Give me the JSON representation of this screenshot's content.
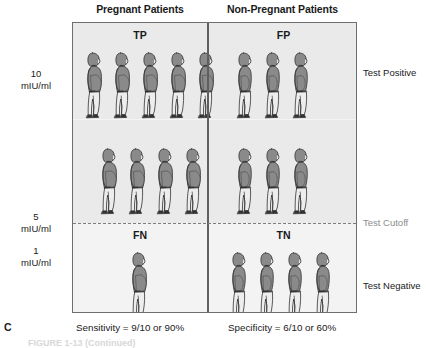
{
  "headers": {
    "left_column": "Pregnant Patients",
    "right_column": "Non-Pregnant Patients"
  },
  "quadrants": {
    "true_positive": {
      "label": "TP",
      "count": 9,
      "figure_type": "pregnant"
    },
    "false_positive": {
      "label": "FP",
      "count": 6,
      "figure_type": "non-pregnant"
    },
    "false_negative": {
      "label": "FN",
      "count": 1,
      "figure_type": "pregnant"
    },
    "true_negative": {
      "label": "TN",
      "count": 4,
      "figure_type": "non-pregnant"
    }
  },
  "figure_rows": {
    "tp_row_1": 5,
    "tp_row_2": 4,
    "fp_row_1": 3,
    "fp_row_2": 3,
    "fn_row_1": 1,
    "tn_row_1": 4
  },
  "axis": {
    "value_10": "10\nmIU/ml",
    "value_10_number": "10",
    "value_10_unit": "mIU/ml",
    "value_5_number": "5",
    "value_5_unit": "mIU/ml",
    "value_1_number": "1",
    "value_1_unit": "mIU/ml"
  },
  "side_labels": {
    "test_positive": "Test Positive",
    "test_cutoff": "Test Cutoff",
    "test_negative": "Test Negative"
  },
  "captions": {
    "panel_letter": "C",
    "sensitivity": "Sensitivity = 9/10 or 90%",
    "specificity": "Specificity = 6/10 or 60%",
    "figure_caption_remnant": "FIGURE 1-13  (Continued)"
  },
  "colors": {
    "panel_background_above_cutoff": "#eaeaea",
    "panel_background_below_cutoff": "#f3f3f3",
    "panel_border": "#6e6e6e",
    "divider": "#5f5f5f",
    "cutoff_line": "#7d7d7d",
    "figure_torso": "#8a8a8a",
    "figure_pants": "#ededed",
    "figure_outline": "#333333",
    "cutoff_label_text": "#8c8c8c"
  }
}
